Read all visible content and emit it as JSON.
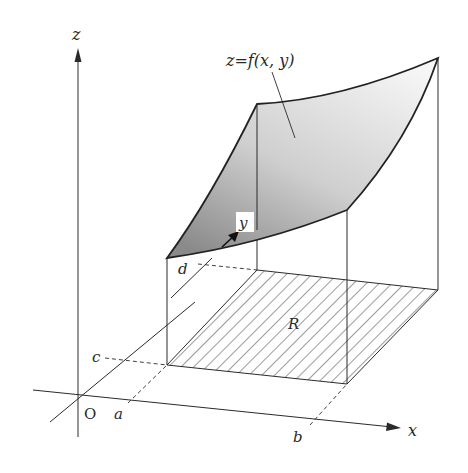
{
  "figure": {
    "colors": {
      "line": "#2a2a2a",
      "surface_dark": "#8c8c8c",
      "surface_light": "#f4f4f4",
      "hatch": "#3a3a3a",
      "background": "#ffffff"
    },
    "labels": {
      "z_axis": "z",
      "x_axis": "x",
      "y_axis": "y",
      "origin": "O",
      "a": "a",
      "b": "b",
      "c": "c",
      "d": "d",
      "region": "R",
      "surface": "z=f(x, y)"
    }
  }
}
